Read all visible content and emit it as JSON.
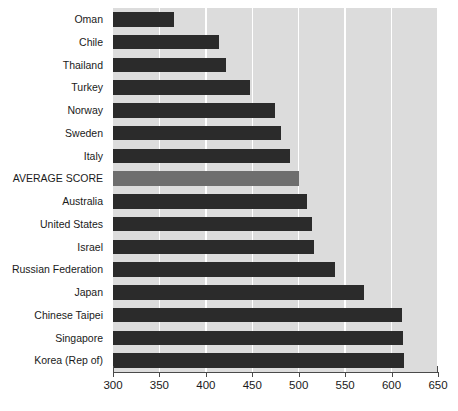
{
  "chart_data": {
    "type": "bar",
    "orientation": "horizontal",
    "title": "",
    "subtitle": "",
    "xlabel": "",
    "ylabel": "",
    "xlim": [
      300,
      650
    ],
    "grid": true,
    "legend": false,
    "xticks": [
      300,
      350,
      400,
      450,
      500,
      550,
      600,
      650
    ],
    "xtick_labels": [
      "300",
      "350",
      "400",
      "450",
      "500",
      "550",
      "600",
      "650"
    ],
    "categories": [
      "Oman",
      "Chile",
      "Thailand",
      "Turkey",
      "Norway",
      "Sweden",
      "Italy",
      "AVERAGE SCORE",
      "Australia",
      "United States",
      "Israel",
      "Russian Federation",
      "Japan",
      "Chinese Taipei",
      "Singapore",
      "Korea (Rep of)"
    ],
    "values": [
      366,
      414,
      422,
      448,
      474,
      481,
      491,
      500,
      509,
      514,
      516,
      539,
      570,
      611,
      612,
      613
    ],
    "colors": {
      "bar": "#2b2b2b",
      "highlight_bar": "#6e6e6e",
      "plot_background": "#dcdcdc",
      "gridline": "#ffffff",
      "axis": "#4a4a4a",
      "text": "#1a1a1a",
      "page_background": "#ffffff"
    },
    "highlight_category": "AVERAGE SCORE"
  }
}
